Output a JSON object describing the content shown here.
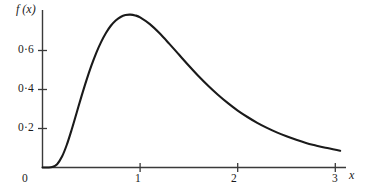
{
  "chart_data": {
    "type": "line",
    "title": "",
    "subtitle": "",
    "xlabel": "x",
    "ylabel": "f (x)",
    "xlim": [
      0,
      3.1
    ],
    "ylim": [
      0,
      0.86
    ],
    "grid": false,
    "legend": null,
    "x_ticks": [
      {
        "value": 0,
        "label": "0"
      },
      {
        "value": 1,
        "label": "1"
      },
      {
        "value": 2,
        "label": "2"
      },
      {
        "value": 3,
        "label": "3"
      }
    ],
    "y_ticks": [
      {
        "value": 0.2,
        "label": "0·2"
      },
      {
        "value": 0.4,
        "label": "0·4"
      },
      {
        "value": 0.6,
        "label": "0·6"
      }
    ],
    "decimal_separator": "middle-dot",
    "curve_color": "#1a1a1a",
    "axis_color": "#3a3a3a",
    "background_color": "#ffffff",
    "peak": {
      "x": 0.72,
      "y": 0.77
    },
    "series": [
      {
        "name": "f(x)",
        "x": [
          0.0,
          0.05,
          0.1,
          0.15,
          0.2,
          0.25,
          0.3,
          0.35,
          0.4,
          0.45,
          0.5,
          0.55,
          0.6,
          0.65,
          0.7,
          0.75,
          0.8,
          0.85,
          0.9,
          0.95,
          1.0,
          1.1,
          1.2,
          1.3,
          1.4,
          1.5,
          1.6,
          1.7,
          1.8,
          1.9,
          2.0,
          2.1,
          2.2,
          2.3,
          2.4,
          2.5,
          2.6,
          2.7,
          2.8,
          2.9,
          3.05
        ],
        "values": [
          0.0,
          0.0,
          0.002,
          0.017,
          0.056,
          0.118,
          0.196,
          0.281,
          0.366,
          0.447,
          0.521,
          0.587,
          0.643,
          0.69,
          0.727,
          0.754,
          0.772,
          0.782,
          0.784,
          0.78,
          0.77,
          0.735,
          0.688,
          0.634,
          0.578,
          0.522,
          0.468,
          0.418,
          0.372,
          0.33,
          0.292,
          0.259,
          0.229,
          0.203,
          0.18,
          0.16,
          0.142,
          0.126,
          0.113,
          0.101,
          0.086
        ]
      }
    ]
  },
  "figure": {
    "y_axis_label": "f (x)",
    "x_axis_label": "x",
    "y_tick_labels": [
      "0·6",
      "0·4",
      "0·2"
    ],
    "x_tick_labels": [
      "0",
      "1",
      "2",
      "3"
    ]
  }
}
